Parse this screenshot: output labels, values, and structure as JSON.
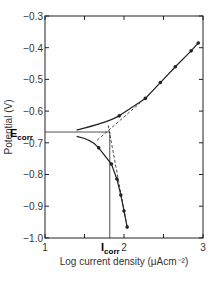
{
  "chart_data": {
    "type": "line",
    "title": "",
    "xlabel": "Log current density (μAcm⁻²)",
    "ylabel": "Potential (V)",
    "xlim": [
      1,
      3
    ],
    "ylim": [
      -1.0,
      -0.3
    ],
    "xticks": [
      "1",
      "2",
      "3"
    ],
    "yticks": [
      "-0.3",
      "-0.4",
      "-0.5",
      "-0.6",
      "-0.7",
      "-0.8",
      "-0.9",
      "-1.0"
    ],
    "grid": false,
    "series": [
      {
        "name": "Anodic branch",
        "x": [
          1.94,
          2.27,
          2.46,
          2.65,
          2.85,
          2.94
        ],
        "y": [
          -0.615,
          -0.56,
          -0.51,
          -0.46,
          -0.41,
          -0.385
        ]
      },
      {
        "name": "Cathodic branch",
        "x": [
          1.68,
          1.84,
          1.91,
          1.96,
          2.0,
          2.04
        ],
        "y": [
          -0.716,
          -0.767,
          -0.814,
          -0.865,
          -0.915,
          -0.966
        ]
      }
    ],
    "annotations": [
      {
        "label": "E_corr",
        "value": -0.666,
        "axis": "y"
      },
      {
        "label": "I_corr",
        "value": 1.82,
        "axis": "x"
      }
    ]
  },
  "labels": {
    "ecorr": "E",
    "ecorr_sub": "corr",
    "icorr": "I",
    "icorr_sub": "corr",
    "xlabel": "Log current density (μAcm⁻²)",
    "ylabel": "Potential (V)",
    "y": [
      "−0.3",
      "−0.4",
      "−0.5",
      "−0.6",
      "−0.7",
      "−0.8",
      "−0.9",
      "−1.0"
    ],
    "x1": "1",
    "x2": "2",
    "x3": "3"
  }
}
